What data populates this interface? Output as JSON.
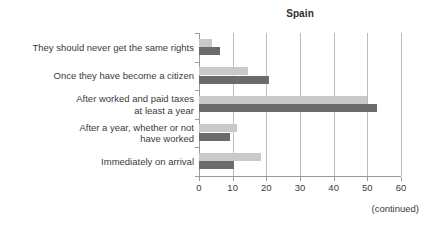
{
  "chart_data": {
    "type": "bar",
    "orientation": "horizontal",
    "title": "Spain",
    "xlabel": "",
    "ylabel": "",
    "xlim": [
      0,
      60
    ],
    "xticks": [
      0,
      10,
      20,
      30,
      40,
      50,
      60
    ],
    "grid": "vertical",
    "legend": "none",
    "categories": [
      "They should never get the same rights",
      "Once they have become a citizen",
      "After worked and paid taxes\nat least a year",
      "After a year, whether or not\nhave worked",
      "Immediately on arrival"
    ],
    "series": [
      {
        "name": "series-light",
        "color": "#c9c9c9",
        "values": [
          3.8,
          14.6,
          50.0,
          11.4,
          18.3
        ]
      },
      {
        "name": "series-dark",
        "color": "#6b6b6b",
        "values": [
          6.2,
          20.9,
          52.8,
          9.3,
          10.4
        ]
      }
    ]
  },
  "footer": {
    "note": "(continued)"
  },
  "colors": {
    "light_bar": "#c9c9c9",
    "dark_bar": "#6b6b6b",
    "gridline": "#bdbdbd",
    "axis": "#9a9a9a",
    "text": "#3b3b3b",
    "background": "#ffffff"
  }
}
